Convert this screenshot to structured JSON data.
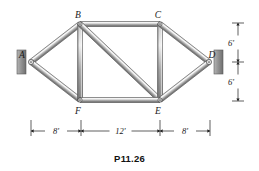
{
  "figure": {
    "caption": "P11.26",
    "type": "plane-truss-diagram"
  },
  "joints": [
    {
      "id": "A",
      "label": "A",
      "x": 31,
      "y": 62,
      "support": "pin"
    },
    {
      "id": "B",
      "label": "B",
      "x": 80,
      "y": 24,
      "support": "none"
    },
    {
      "id": "C",
      "label": "C",
      "x": 160,
      "y": 24,
      "support": "none"
    },
    {
      "id": "D",
      "label": "D",
      "x": 209,
      "y": 62,
      "support": "pin"
    },
    {
      "id": "E",
      "label": "E",
      "x": 160,
      "y": 100,
      "support": "none"
    },
    {
      "id": "F",
      "label": "F",
      "x": 80,
      "y": 100,
      "support": "none"
    }
  ],
  "joint_label_offsets": [
    {
      "id": "A",
      "dx": -9,
      "dy": -4
    },
    {
      "id": "B",
      "dx": -2,
      "dy": -6
    },
    {
      "id": "C",
      "dx": -2,
      "dy": -6
    },
    {
      "id": "D",
      "dx": 3,
      "dy": -4
    },
    {
      "id": "E",
      "dx": -2,
      "dy": 14
    },
    {
      "id": "F",
      "dx": -2,
      "dy": 14
    }
  ],
  "members": [
    {
      "from": "A",
      "to": "B"
    },
    {
      "from": "A",
      "to": "F"
    },
    {
      "from": "B",
      "to": "C"
    },
    {
      "from": "B",
      "to": "F"
    },
    {
      "from": "B",
      "to": "E"
    },
    {
      "from": "C",
      "to": "E"
    },
    {
      "from": "C",
      "to": "D"
    },
    {
      "from": "E",
      "to": "D"
    },
    {
      "from": "F",
      "to": "E"
    }
  ],
  "supports": [
    {
      "id": "support-left",
      "joint": "A",
      "wall_x": 17,
      "wall_y": 50,
      "wall_w": 9,
      "wall_h": 24
    },
    {
      "id": "support-right",
      "joint": "D",
      "wall_x": 214,
      "wall_y": 50,
      "wall_w": 9,
      "wall_h": 24
    }
  ],
  "dimensions": {
    "horizontal": {
      "y": 131,
      "extension_top": 120,
      "segments": [
        {
          "label": "8'",
          "x1": 31,
          "x2": 81,
          "value": 8,
          "unit": "ft"
        },
        {
          "label": "12'",
          "x1": 81,
          "x2": 160,
          "value": 12,
          "unit": "ft"
        },
        {
          "label": "8'",
          "x1": 160,
          "x2": 210,
          "value": 8,
          "unit": "ft"
        }
      ]
    },
    "vertical": {
      "x": 238,
      "segments": [
        {
          "label": "6'",
          "y1": 23,
          "y2": 62,
          "value": 6,
          "unit": "ft"
        },
        {
          "label": "6'",
          "y1": 62,
          "y2": 101,
          "value": 6,
          "unit": "ft"
        }
      ]
    }
  },
  "colors": {
    "member_light": "#d8d8d8",
    "member_mid": "#a8a8a8",
    "member_dark": "#6e6e6e",
    "member_edge": "#4a4a4a",
    "support_fill": "#8f8f8f",
    "support_edge": "#5a5a5a",
    "ink": "#1a1a1a",
    "background": "#ffffff"
  }
}
